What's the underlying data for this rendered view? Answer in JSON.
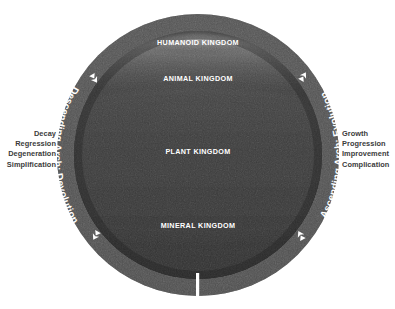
{
  "diagram": {
    "background_color": "#ffffff",
    "circle": {
      "center_x": 198,
      "center_y": 155,
      "radius": 141,
      "rim_color": "#4a4a4a",
      "body_color": "#2e2e2e"
    },
    "bottom_marker": {
      "name": "bottom-tick-mark",
      "color": "#ffffff",
      "x": 197,
      "top_y": 273,
      "bottom_y": 301,
      "width": 3
    },
    "kingdoms": [
      {
        "id": "humanoid",
        "label": "HUMANOID KINGDOM",
        "band_color": "#9a9a9a",
        "label_color": "#ffffff",
        "label_x": 198,
        "label_y": 44
      },
      {
        "id": "animal",
        "label": "ANIMAL KINGDOM",
        "band_color": "#6e6e6e",
        "label_color": "#ffffff",
        "label_x": 198,
        "label_y": 79
      },
      {
        "id": "plant",
        "label": "PLANT KINGDOM",
        "band_color": "#333333",
        "label_color": "#ffffff",
        "label_x": 198,
        "label_y": 152
      },
      {
        "id": "mineral",
        "label": "MINERAL KINGDOM",
        "band_color": "#262626",
        "label_color": "#ffffff",
        "label_x": 198,
        "label_y": 226
      }
    ],
    "arches": [
      {
        "id": "descending",
        "label": "Descending Arch: Devolution",
        "side": "left",
        "text_color": "#ffffff",
        "arrow_glyph": "⮟",
        "arrow_start_name": "descending-arch-arrow-top",
        "arrow_end_name": "descending-arch-arrow-bottom"
      },
      {
        "id": "ascending",
        "label": "Ascending Arch: Evolution",
        "side": "right",
        "text_color": "#ffffff",
        "arrow_glyph": "⮝",
        "arrow_start_name": "ascending-arch-arrow-bottom",
        "arrow_end_name": "ascending-arch-arrow-top"
      }
    ],
    "captions": {
      "left": {
        "align": "right",
        "color": "#3b3b3b",
        "lines": [
          "Decay",
          "Regression",
          "Degeneration",
          "Simplification"
        ]
      },
      "right": {
        "align": "left",
        "color": "#3b3b3b",
        "lines": [
          "Growth",
          "Progression",
          "Improvement",
          "Complication"
        ]
      }
    }
  }
}
